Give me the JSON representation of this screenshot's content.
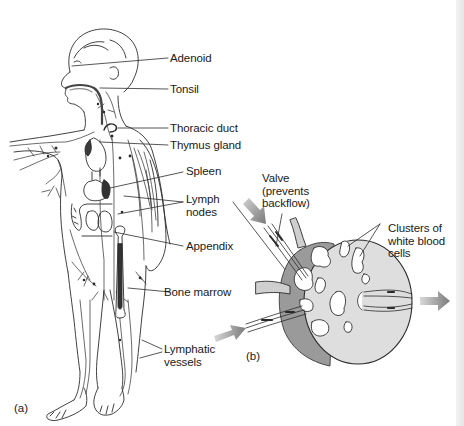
{
  "figure": {
    "panel_a": {
      "id_label": "(a)",
      "subject": "child figure showing lymphatic system",
      "labels": [
        {
          "key": "adenoid",
          "text": "Adenoid"
        },
        {
          "key": "tonsil",
          "text": "Tonsil"
        },
        {
          "key": "thoracic_duct",
          "text": "Thoracic duct"
        },
        {
          "key": "thymus_gland",
          "text": "Thymus gland"
        },
        {
          "key": "spleen",
          "text": "Spleen"
        },
        {
          "key": "lymph_nodes",
          "text": "Lymph\nnodes"
        },
        {
          "key": "appendix",
          "text": "Appendix"
        },
        {
          "key": "bone_marrow",
          "text": "Bone marrow"
        },
        {
          "key": "lymphatic_vessels",
          "text": "Lymphatic\nvessels"
        }
      ]
    },
    "panel_b": {
      "id_label": "(b)",
      "subject": "cross-section of a lymph node",
      "labels": [
        {
          "key": "valve",
          "text": "Valve\n(prevents\nbackflow)"
        },
        {
          "key": "clusters",
          "text": "Clusters of\nwhite blood\ncells"
        }
      ]
    },
    "colors": {
      "line": "#2b2b2b",
      "node_fill": "#dedede",
      "node_side": "#9a9a9a",
      "arrow": "#8a8a8a",
      "organ_dark": "#3a3a3a"
    }
  }
}
